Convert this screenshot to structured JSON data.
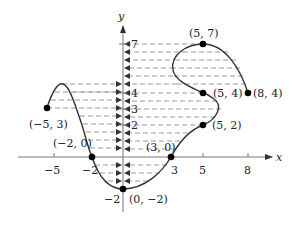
{
  "diagram": {
    "type": "function-graph-range-projection",
    "axes": {
      "x_label": "x",
      "y_label": "y",
      "x_ticks": [
        "−5",
        "−2",
        "3",
        "5",
        "8"
      ],
      "y_ticks": [
        "7",
        "4",
        "3",
        "2",
        "−2"
      ]
    },
    "points": [
      {
        "label": "(−5, 3)",
        "x": -5,
        "y": 3
      },
      {
        "label": "(−2, 0)",
        "x": -2,
        "y": 0
      },
      {
        "label": "(0, −2)",
        "x": 0,
        "y": -2
      },
      {
        "label": "(3, 0)",
        "x": 3,
        "y": 0
      },
      {
        "label": "(5, 2)",
        "x": 5,
        "y": 2
      },
      {
        "label": "(5, 4)",
        "x": 5,
        "y": 4
      },
      {
        "label": "(5, 7)",
        "x": 5,
        "y": 7
      },
      {
        "label": "(8, 4)",
        "x": 8,
        "y": 4
      }
    ],
    "colors": {
      "curve": "#333333",
      "axis": "#888888",
      "dash": "#999999",
      "point": "#000000"
    }
  }
}
